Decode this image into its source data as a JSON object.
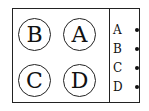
{
  "diagram": {
    "circles": [
      {
        "label": "B",
        "position": "top-left"
      },
      {
        "label": "A",
        "position": "top-right"
      },
      {
        "label": "C",
        "position": "bottom-left"
      },
      {
        "label": "D",
        "position": "bottom-right"
      }
    ],
    "legend": [
      {
        "label": "A"
      },
      {
        "label": "B"
      },
      {
        "label": "C"
      },
      {
        "label": "D"
      }
    ]
  }
}
